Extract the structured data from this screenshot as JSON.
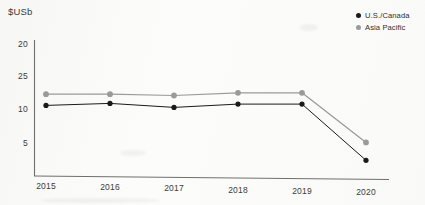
{
  "chart_data": {
    "type": "line",
    "title": "",
    "subtitle": "",
    "xlabel": "",
    "ylabel": "$USb",
    "unit_label": "$USb",
    "categories": [
      "2015",
      "2016",
      "2017",
      "2018",
      "2019",
      "2020"
    ],
    "x": [
      2015,
      2016,
      2017,
      2018,
      2019,
      2020
    ],
    "ytick_labels": [
      "20",
      "25",
      "10",
      "5"
    ],
    "ytick_values": [
      20,
      15,
      10,
      5
    ],
    "ylim": [
      0,
      21.5
    ],
    "xlim": [
      2014.7,
      2020.3
    ],
    "grid": false,
    "legend_position": "top-right",
    "series": [
      {
        "name": "U.S./Canada",
        "color": "#1a1a1a",
        "marker": "circle",
        "values": [
          10.6,
          11.0,
          10.5,
          11.1,
          11.2,
          2.8
        ]
      },
      {
        "name": "Asia Pacific",
        "color": "#9a9a9a",
        "marker": "circle",
        "values": [
          12.3,
          12.4,
          12.3,
          12.8,
          12.9,
          5.5
        ]
      }
    ]
  },
  "legend": {
    "items": [
      {
        "label": "U.S./Canada",
        "color": "#1a1a1a"
      },
      {
        "label": "Asia Pacific",
        "color": "#9a9a9a"
      }
    ]
  },
  "axes": {
    "y_unit": "$USb",
    "y_ticks": [
      "20",
      "25",
      "10",
      "5"
    ],
    "x_ticks": [
      "2015",
      "2016",
      "2017",
      "2018",
      "2019",
      "2020"
    ]
  },
  "colors": {
    "series_primary": "#1a1a1a",
    "series_secondary": "#9a9a9a",
    "axis": "#6b6b6b",
    "text": "#3b3b3b",
    "background": "#fcfcfb"
  }
}
